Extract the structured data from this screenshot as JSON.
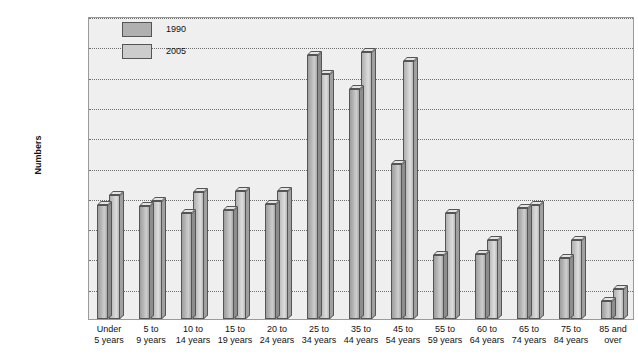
{
  "chart_data": {
    "type": "bar",
    "title": "",
    "xlabel": "",
    "ylabel": "Numbers",
    "ylim": [
      0,
      50000000
    ],
    "ytick_step": 5000000,
    "grid": true,
    "legend_position": "top-left-inside",
    "categories": [
      "Under 5 years",
      "5 to 9 years",
      "10 to 14 years",
      "15 to 19 years",
      "20 to 24 years",
      "25 to 34 years",
      "35 to 44 years",
      "45 to 54 years",
      "55 to 59 years",
      "60 to 64 years",
      "65 to 74 years",
      "75 to 84 years",
      "85 and over"
    ],
    "category_lines": [
      [
        "Under",
        "5 years"
      ],
      [
        "5 to",
        "9 years"
      ],
      [
        "10 to",
        "14 years"
      ],
      [
        "15 to",
        "19 years"
      ],
      [
        "20 to",
        "24 years"
      ],
      [
        "25 to",
        "34 years"
      ],
      [
        "35 to",
        "44 years"
      ],
      [
        "45 to",
        "54 years"
      ],
      [
        "55 to",
        "59 years"
      ],
      [
        "60 to",
        "64 years"
      ],
      [
        "65 to",
        "74 years"
      ],
      [
        "75 to",
        "84 years"
      ],
      [
        "85 and",
        "over"
      ]
    ],
    "ytick_labels": [
      "0",
      "5,000,000",
      "10,000,000",
      "15,000,000",
      "20,000,000",
      "25,000,000",
      "30,000,000",
      "35,000,000",
      "40,000,000",
      "45,000,000",
      "50,000,000"
    ],
    "ytick_values": [
      0,
      5000000,
      10000000,
      15000000,
      20000000,
      25000000,
      30000000,
      35000000,
      40000000,
      45000000,
      50000000
    ],
    "series": [
      {
        "name": "1990",
        "color": "#b0b0b0",
        "values": [
          18800000,
          18600000,
          17500000,
          18000000,
          19000000,
          43500000,
          38000000,
          25500000,
          10500000,
          10800000,
          18300000,
          10000000,
          3000000
        ]
      },
      {
        "name": "2005",
        "color": "#cccccc",
        "values": [
          20500000,
          19500000,
          20900000,
          21200000,
          21100000,
          40500000,
          44000000,
          42500000,
          17500000,
          13000000,
          18800000,
          13000000,
          5000000
        ]
      }
    ]
  }
}
